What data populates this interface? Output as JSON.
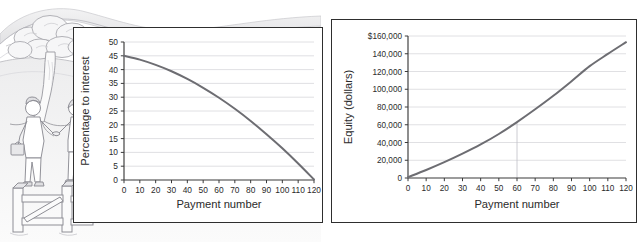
{
  "figure": {
    "illustration": {
      "name": "mortgage-handshake-scene",
      "elements": [
        "rolling-hills",
        "tree",
        "two-people-shaking-hands",
        "briefcase",
        "handbag",
        "wooden-gate-fence"
      ]
    },
    "caption_fragment": ""
  },
  "chart_data": [
    {
      "id": "interest-chart",
      "type": "line",
      "title": "",
      "xlabel": "Payment number",
      "ylabel": "Percentage to interest",
      "xlim": [
        0,
        120
      ],
      "ylim": [
        0,
        50
      ],
      "xticks": [
        0,
        10,
        20,
        30,
        40,
        50,
        60,
        70,
        80,
        90,
        100,
        110,
        120
      ],
      "yticks": [
        0,
        5,
        10,
        15,
        20,
        25,
        30,
        35,
        40,
        45,
        50
      ],
      "xticklabels": [
        "0",
        "10",
        "20",
        "30",
        "40",
        "50",
        "60",
        "70",
        "80",
        "90",
        "100",
        "110",
        "120"
      ],
      "yticklabels": [
        "0",
        "5",
        "10",
        "15",
        "20",
        "25",
        "30",
        "35",
        "40",
        "45",
        "50"
      ],
      "grid": "horizontal",
      "legend": "none",
      "series": [
        {
          "name": "Percentage to interest",
          "color": "#6d6d72",
          "x": [
            0,
            10,
            20,
            30,
            40,
            50,
            60,
            70,
            80,
            90,
            100,
            110,
            120
          ],
          "y": [
            45.0,
            43.6,
            41.7,
            39.4,
            36.6,
            33.4,
            29.8,
            25.8,
            21.4,
            16.6,
            11.5,
            6.0,
            0.2
          ]
        }
      ]
    },
    {
      "id": "equity-chart",
      "type": "line",
      "title": "",
      "xlabel": "Payment number",
      "ylabel": "Equity (dollars)",
      "xlim": [
        0,
        120
      ],
      "ylim": [
        0,
        160000
      ],
      "xticks": [
        0,
        10,
        20,
        30,
        40,
        50,
        60,
        70,
        80,
        90,
        100,
        110,
        120
      ],
      "yticks": [
        0,
        20000,
        40000,
        60000,
        80000,
        100000,
        120000,
        140000,
        160000
      ],
      "xticklabels": [
        "0",
        "10",
        "20",
        "30",
        "40",
        "50",
        "60",
        "70",
        "80",
        "90",
        "100",
        "110",
        "120"
      ],
      "yticklabels": [
        "0",
        "20,000",
        "40,000",
        "60,000",
        "80,000",
        "100,000",
        "120,000",
        "140,000",
        "$160,000"
      ],
      "grid": "horizontal",
      "legend": "none",
      "annotations": [
        {
          "name": "reference-line-payment-60",
          "x": 60,
          "y": 63000,
          "color": "#bfbfc6"
        }
      ],
      "series": [
        {
          "name": "Equity (dollars)",
          "color": "#6d6d72",
          "x": [
            0,
            10,
            20,
            30,
            40,
            50,
            60,
            70,
            80,
            90,
            100,
            110,
            120
          ],
          "y": [
            900,
            9000,
            17800,
            27400,
            37800,
            49600,
            63000,
            77400,
            92600,
            109000,
            126000,
            139800,
            153000
          ]
        }
      ]
    }
  ]
}
